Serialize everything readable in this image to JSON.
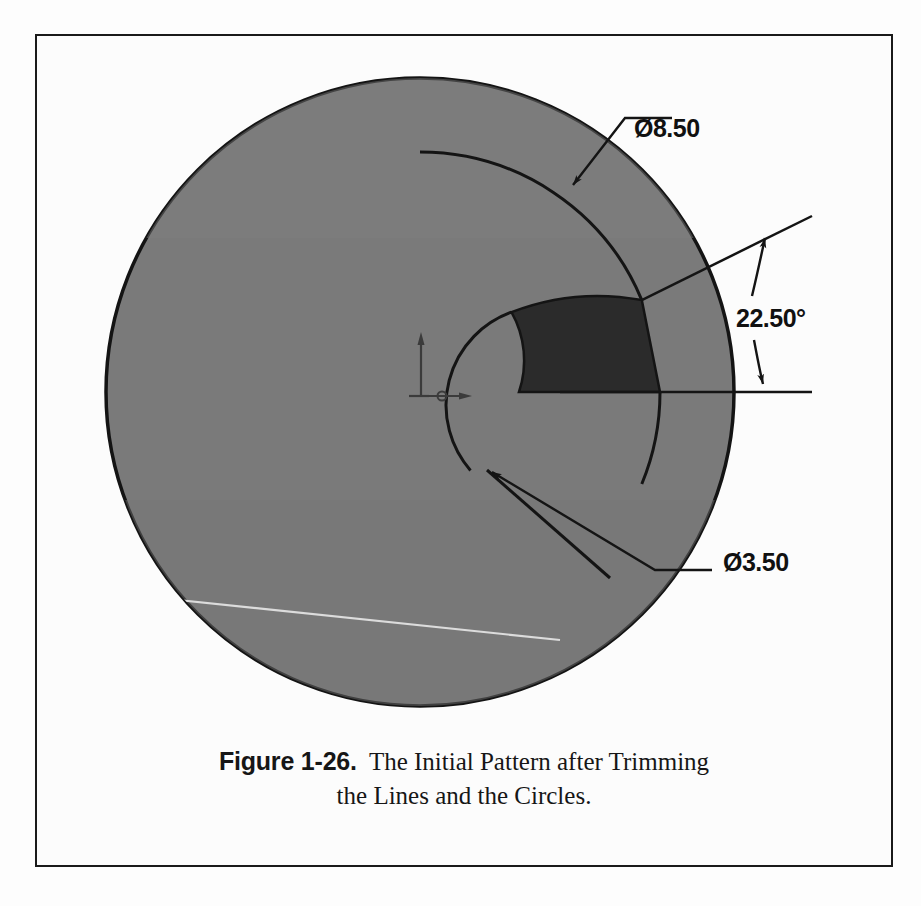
{
  "figure": {
    "border_color": "#1a1a1a",
    "page_background": "#fdfdfd"
  },
  "caption": {
    "label": "Figure 1-26.",
    "line1": "The Initial Pattern after Trimming",
    "line2": "the Lines and the Circles."
  },
  "drawing": {
    "title": "Initial Pattern after Trimming",
    "colors": {
      "disc_fill": "#7a7a7a",
      "wedge_fill": "#2b2b2b",
      "outline": "#141414",
      "artifact_line": "#d8d8d8"
    },
    "geometry": {
      "center_x": 420,
      "center_y": 392,
      "outer_radius": 314,
      "bolt_circle_radius": 240,
      "inner_radius": 99,
      "wedge_start_angle_deg": 0,
      "wedge_end_angle_deg": 22.5
    },
    "origin_marker": {
      "name": "origin-triad",
      "x": 420,
      "y": 392
    }
  },
  "dimensions": [
    {
      "id": "outer-diameter",
      "label": "Ø8.50",
      "value": 8.5,
      "symbol": "Ø",
      "text_x": 634,
      "text_y": 128
    },
    {
      "id": "included-angle",
      "label": "22.50°",
      "value": 22.5,
      "symbol": "°",
      "text_x": 736,
      "text_y": 318
    },
    {
      "id": "inner-diameter",
      "label": "Ø3.50",
      "value": 3.5,
      "symbol": "Ø",
      "text_x": 723,
      "text_y": 562
    }
  ]
}
